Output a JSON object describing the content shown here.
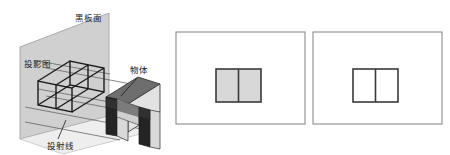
{
  "figure": {
    "title": "",
    "canvas": {
      "width": 450,
      "height": 155,
      "background": "#ffffff"
    },
    "colors": {
      "projection_plane_fill": "#d0d0d0",
      "projection_plane_stroke": "#9a9a9a",
      "object_top_face": "#6e6e6e",
      "object_front_face": "#2a2a2a",
      "object_side_face": "#e2e2e2",
      "wireframe_stroke": "#1a1a1a",
      "ray_stroke": "#555555",
      "panel_border": "#8c8c8c",
      "shape_fill_gray": "#d8d8d8",
      "shape_fill_white": "#ffffff",
      "shape_stroke": "#3a3a3a",
      "label_text": "#1a1a1a"
    }
  },
  "diagram_3d": {
    "name": "projection-illustration",
    "labels": [
      {
        "id": "blackboard-surface",
        "text": "黑板面",
        "x": 88,
        "y": 21,
        "anchor": "middle"
      },
      {
        "id": "projection-drawing",
        "text": "投影图",
        "x": 37,
        "y": 67,
        "anchor": "middle"
      },
      {
        "id": "object",
        "text": "物体",
        "x": 139,
        "y": 73,
        "anchor": "middle"
      },
      {
        "id": "projection-rays",
        "text": "投射线",
        "x": 60,
        "y": 146,
        "anchor": "middle"
      }
    ],
    "leader_lines": [
      {
        "id": "object-leader",
        "x1": 137,
        "y1": 78,
        "x2": 121,
        "y2": 96
      },
      {
        "id": "rays-leader",
        "x1": 58,
        "y1": 139,
        "x2": 66,
        "y2": 120
      }
    ]
  },
  "panels": [
    {
      "id": "panel-filled",
      "name": "projection-view-shaded",
      "frame": {
        "x": 176,
        "y": 32,
        "width": 129,
        "height": 92
      },
      "shape": {
        "x": 216,
        "y": 69,
        "width": 45,
        "height": 33,
        "fill": "#d8d8d8",
        "divider_offset": 22
      }
    },
    {
      "id": "panel-outline",
      "name": "projection-view-outline",
      "frame": {
        "x": 313,
        "y": 32,
        "width": 129,
        "height": 92
      },
      "shape": {
        "x": 353,
        "y": 69,
        "width": 45,
        "height": 33,
        "fill": "#ffffff",
        "divider_offset": 22
      }
    }
  ]
}
